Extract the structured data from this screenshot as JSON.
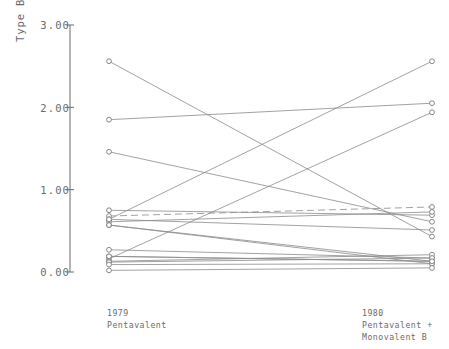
{
  "axes": {
    "y_title": "Type B Titers (geometric mean)",
    "y_ticks": [
      "3.00",
      "2.00",
      "1.00",
      "0.00"
    ],
    "x_labels": [
      {
        "line1": "1979",
        "line2": "Pentavalent",
        "line3": ""
      },
      {
        "line1": "1980",
        "line2": "Pentavalent +",
        "line3": "Monovalent B"
      }
    ]
  },
  "chart_data": {
    "type": "line",
    "subtype": "paired-slope-chart",
    "title": "",
    "xlabel": "",
    "ylabel": "Type B Titers (geometric mean)",
    "ylim": [
      0.0,
      3.0
    ],
    "ytick_values": [
      0.0,
      1.0,
      2.0,
      3.0
    ],
    "grid": false,
    "legend": "none",
    "marker": "open-circle",
    "categories": [
      "1979 Pentavalent",
      "1980 Pentavalent + Monovalent B"
    ],
    "series": [
      {
        "name": "s1",
        "values": [
          2.56,
          0.43
        ],
        "style": "solid"
      },
      {
        "name": "s2",
        "values": [
          1.85,
          2.05
        ],
        "style": "solid"
      },
      {
        "name": "s3",
        "values": [
          1.46,
          0.61
        ],
        "style": "solid"
      },
      {
        "name": "s4",
        "values": [
          0.75,
          0.69
        ],
        "style": "solid"
      },
      {
        "name": "s5",
        "values": [
          0.68,
          0.79
        ],
        "style": "dashed"
      },
      {
        "name": "s6",
        "values": [
          0.64,
          0.51
        ],
        "style": "solid"
      },
      {
        "name": "s7",
        "values": [
          0.61,
          0.73
        ],
        "style": "solid"
      },
      {
        "name": "s8",
        "values": [
          0.57,
          0.13
        ],
        "style": "solid"
      },
      {
        "name": "s9",
        "values": [
          0.57,
          0.1
        ],
        "style": "solid"
      },
      {
        "name": "s10",
        "values": [
          0.27,
          0.17
        ],
        "style": "solid"
      },
      {
        "name": "s11",
        "values": [
          0.19,
          0.13
        ],
        "style": "solid"
      },
      {
        "name": "s12",
        "values": [
          0.16,
          1.94
        ],
        "style": "solid"
      },
      {
        "name": "s13",
        "values": [
          0.13,
          0.21
        ],
        "style": "solid"
      },
      {
        "name": "s14",
        "values": [
          0.12,
          0.17
        ],
        "style": "solid"
      },
      {
        "name": "s15",
        "values": [
          0.09,
          0.1
        ],
        "style": "solid"
      },
      {
        "name": "s16",
        "values": [
          0.02,
          0.05
        ],
        "style": "solid"
      },
      {
        "name": "s17",
        "values": [
          0.64,
          2.56
        ],
        "style": "solid"
      },
      {
        "name": "s18",
        "values": [
          0.19,
          0.13
        ],
        "style": "solid"
      }
    ]
  },
  "colors": {
    "ink": "#6a6a6a",
    "line": "#8a8a8a",
    "marker_stroke": "#7a7a7a"
  }
}
